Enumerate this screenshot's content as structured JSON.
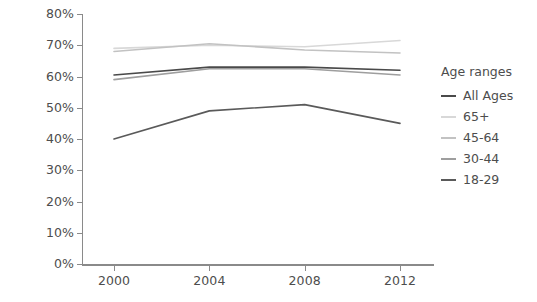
{
  "chart_data": {
    "type": "line",
    "title": "",
    "xlabel": "",
    "ylabel": "",
    "x": [
      2000,
      2004,
      2008,
      2012
    ],
    "categories": [
      "2000",
      "2004",
      "2008",
      "2012"
    ],
    "ylim": [
      0,
      80
    ],
    "yticks": [
      0,
      10,
      20,
      30,
      40,
      50,
      60,
      70,
      80
    ],
    "ytick_labels": [
      "0%",
      "10%",
      "20%",
      "30%",
      "40%",
      "50%",
      "60%",
      "70%",
      "80%"
    ],
    "xtick_labels": [
      "2000",
      "2004",
      "2008",
      "2012"
    ],
    "grid": false,
    "legend_position": "right",
    "legend_title": "Age ranges",
    "series": [
      {
        "name": "All Ages",
        "values": [
          60.5,
          63.0,
          63.0,
          62.0
        ],
        "color": "#4a4a4a"
      },
      {
        "name": "65+",
        "values": [
          69.0,
          70.0,
          69.5,
          71.5
        ],
        "color": "#d8d8d8"
      },
      {
        "name": "45-64",
        "values": [
          68.0,
          70.5,
          68.5,
          67.5
        ],
        "color": "#c2c2c2"
      },
      {
        "name": "30-44",
        "values": [
          59.0,
          62.5,
          62.5,
          60.5
        ],
        "color": "#9e9e9e"
      },
      {
        "name": "18-29",
        "values": [
          40.0,
          49.0,
          51.0,
          45.0
        ],
        "color": "#5a5a5a"
      }
    ]
  },
  "legend": {
    "title": "Age ranges",
    "items": [
      {
        "label": "All Ages"
      },
      {
        "label": "65+"
      },
      {
        "label": "45-64"
      },
      {
        "label": "30-44"
      },
      {
        "label": "18-29"
      }
    ]
  },
  "axes": {
    "y_labels": [
      "80%",
      "70%",
      "60%",
      "50%",
      "40%",
      "30%",
      "20%",
      "10%",
      "0%"
    ],
    "x_labels": [
      "2000",
      "2004",
      "2008",
      "2012"
    ]
  },
  "colors": {
    "axis": "#8a8a8a",
    "text": "#4d4d4d",
    "background": "#ffffff"
  }
}
